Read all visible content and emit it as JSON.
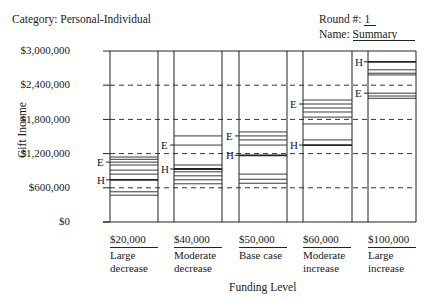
{
  "header": {
    "category_label": "Category:",
    "category_value": "Personal-Individual",
    "round_label": "Round #:",
    "round_value": "1",
    "name_label": "Name:",
    "name_value": "Summary"
  },
  "axes": {
    "ylabel": "Gift Income",
    "xlabel": "Funding Level",
    "yticks": [
      "$3,000,000",
      "$2,400,000",
      "$1,800,000",
      "$1,200,000",
      "$600,000",
      "$0"
    ]
  },
  "columns": [
    {
      "amount": "$20,000",
      "desc1": "Large",
      "desc2": "decrease"
    },
    {
      "amount": "$40,000",
      "desc1": "Moderate",
      "desc2": "decrease"
    },
    {
      "amount": "$50,000",
      "desc1": "Base case",
      "desc2": ""
    },
    {
      "amount": "$60,000",
      "desc1": "Moderate",
      "desc2": "increase"
    },
    {
      "amount": "$100,000",
      "desc1": "Large",
      "desc2": "increase"
    }
  ],
  "markers": {
    "E": "E",
    "H": "H"
  },
  "chart_data": {
    "type": "line",
    "subtype": "range-strip (individual estimate lines per funding level)",
    "title": "",
    "header": {
      "category": "Personal-Individual",
      "round": "1",
      "name": "Summary"
    },
    "xlabel": "Funding Level",
    "ylabel": "Gift Income",
    "ylim": [
      0,
      3000000
    ],
    "yticks": [
      0,
      600000,
      1200000,
      1800000,
      2400000,
      3000000
    ],
    "grid": "dashed horizontal at 600K, 1.2M, 1.8M, 2.4M",
    "categories": [
      "$20,000 Large decrease",
      "$40,000 Moderate decrease",
      "$50,000 Base case",
      "$60,000 Moderate increase",
      "$100,000 Large increase"
    ],
    "series": [
      {
        "name": "$20,000 Large decrease",
        "lines": [
          1140000,
          1100000,
          1050000,
          1000000,
          910000,
          840000,
          740000,
          530000,
          470000
        ],
        "E": 1050000,
        "H": 740000
      },
      {
        "name": "$40,000 Moderate decrease",
        "lines": [
          1510000,
          1350000,
          1000000,
          930000,
          880000,
          810000,
          740000,
          670000
        ],
        "E": 1350000,
        "H": 930000
      },
      {
        "name": "$50,000 Base case",
        "lines": [
          1580000,
          1510000,
          1440000,
          1350000,
          1170000,
          840000,
          750000,
          680000
        ],
        "E": 1510000,
        "H": 1170000
      },
      {
        "name": "$60,000 Moderate increase",
        "lines": [
          2140000,
          2070000,
          2000000,
          1930000,
          1840000,
          1720000,
          1440000,
          1350000
        ],
        "E": 2070000,
        "H": 1350000
      },
      {
        "name": "$100,000 Large increase",
        "lines": [
          2810000,
          2670000,
          2610000,
          2580000,
          2260000,
          2210000,
          2170000
        ],
        "E": 2260000,
        "H": 2810000
      }
    ],
    "bold_line": "H (marked with heavier line)"
  }
}
